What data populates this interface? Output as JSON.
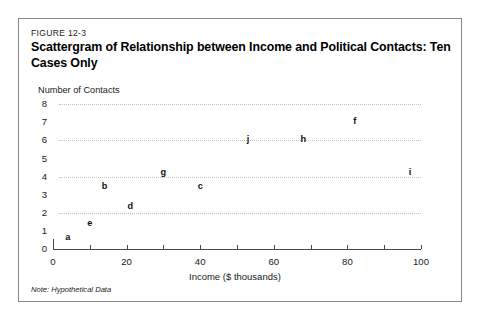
{
  "figure": {
    "label": "FIGURE 12-3",
    "title": "Scattergram of Relationship between Income and Political Contacts: Ten Cases Only",
    "note": "Note: Hypothetical Data",
    "border_color": "#8a8a8a"
  },
  "chart_data": {
    "type": "scatter",
    "title": "Scattergram of Relationship between Income and Political Contacts: Ten Cases Only",
    "xlabel": "Income ($ thousands)",
    "ylabel": "Number of Contacts",
    "xlim": [
      0,
      100
    ],
    "ylim": [
      0,
      8
    ],
    "xticks": [
      0,
      20,
      40,
      60,
      80,
      100
    ],
    "xtick_labels": [
      "0",
      "20",
      "40",
      "60",
      "80",
      "100"
    ],
    "xtick_minor": [
      10,
      30,
      50,
      70,
      90
    ],
    "yticks": [
      0,
      1,
      2,
      3,
      4,
      5,
      6,
      7,
      8
    ],
    "ytick_labels": [
      "0",
      "1",
      "2",
      "3",
      "4",
      "5",
      "6",
      "7",
      "8"
    ],
    "gridlines_y": [
      2,
      4,
      6,
      8
    ],
    "grid": true,
    "legend": false,
    "marker_style": "letter",
    "marker_color": "#111111",
    "points": [
      {
        "label": "a",
        "x": 4,
        "y": 0.6
      },
      {
        "label": "e",
        "x": 10,
        "y": 1.4
      },
      {
        "label": "b",
        "x": 14,
        "y": 3.4
      },
      {
        "label": "d",
        "x": 21,
        "y": 2.3
      },
      {
        "label": "g",
        "x": 30,
        "y": 4.2
      },
      {
        "label": "c",
        "x": 40,
        "y": 3.4
      },
      {
        "label": "j",
        "x": 53,
        "y": 6.0
      },
      {
        "label": "h",
        "x": 68,
        "y": 6.0
      },
      {
        "label": "f",
        "x": 82,
        "y": 7.0
      },
      {
        "label": "i",
        "x": 97,
        "y": 4.2
      }
    ]
  }
}
